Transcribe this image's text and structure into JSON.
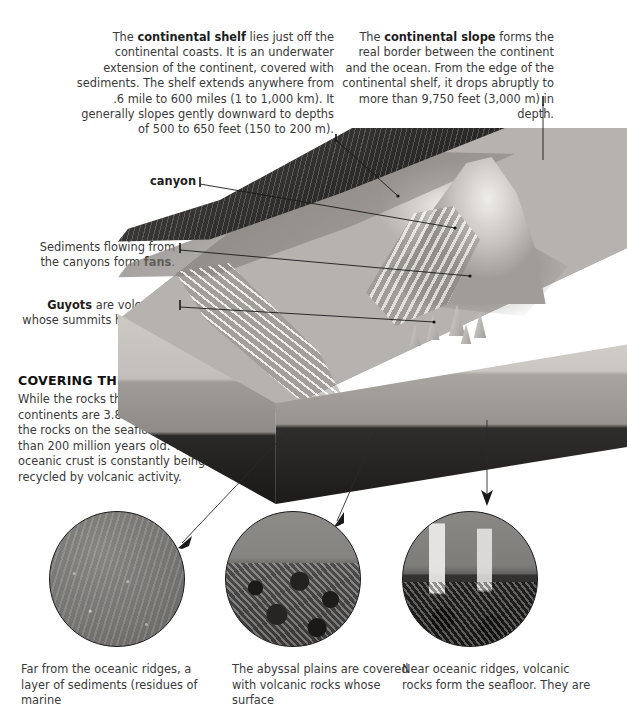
{
  "callouts": {
    "continental_shelf": {
      "lead_bold": "continental shelf",
      "text_before": "The ",
      "text_after": " lies just off the continental coasts. It is an underwater extension of the continent, covered with sediments. The shelf extends anywhere from .6 mile to 600 miles (1 to 1,000 km). It generally slopes gently downward to depths of 500 to 650 feet (150 to 200 m)."
    },
    "continental_slope": {
      "lead_bold": "continental slope",
      "text_before": "The ",
      "text_after": " forms the real border between the continent and the ocean. From the edge of the continental shelf, it drops abruptly to more than 9,750 feet (3,000 m) in depth."
    },
    "canyon": {
      "label": "canyon"
    },
    "fans": {
      "text_before": "Sediments flowing from the canyons form ",
      "lead_bold": "fans",
      "text_after": "."
    },
    "guyots": {
      "lead_bold": "Guyots",
      "text_before": "",
      "text_after": " are volcanoes whose summits have been eroded."
    }
  },
  "section": {
    "heading": "COVERING THE OCEAN FLOOR",
    "body": "While the rocks that form the continents are 3.8 billion years old, the rocks on the seafloor are no more than 200 million years old. The oceanic crust is constantly being recycled by volcanic activity."
  },
  "photos": [
    {
      "name": "sediment-layer-photo",
      "caption": "Far from the oceanic ridges, a layer of sediments (residues of marine"
    },
    {
      "name": "abyssal-plain-photo",
      "caption": "The abyssal plains are covered with volcanic rocks whose surface"
    },
    {
      "name": "oceanic-ridge-photo",
      "caption": "Near oceanic ridges, volcanic rocks form the seafloor. They are"
    }
  ],
  "colors": {
    "text": "#3a3a3a",
    "heading": "#111111",
    "leader_line": "#1a1a1a",
    "background": "#ffffff"
  }
}
